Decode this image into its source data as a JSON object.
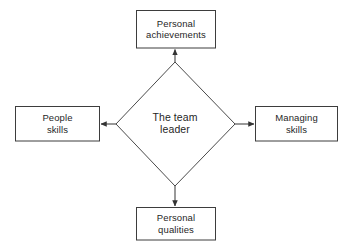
{
  "diagram": {
    "title": "The team leader",
    "type": "radial-diamond-diagram",
    "background_color": "#ffffff",
    "stroke_color": "#404040",
    "text_color": "#1f1f1f",
    "center": {
      "shape": "diamond",
      "label": "The team\nleader",
      "label_line1": "The team",
      "label_line2": "leader"
    },
    "nodes": [
      {
        "id": "personal-achievements",
        "label": "Personal\nachievements",
        "line1": "Personal",
        "line2": "achievements",
        "position": "top",
        "shape": "rectangle"
      },
      {
        "id": "people-skills",
        "label": "People\nskills",
        "line1": "People",
        "line2": "skills",
        "position": "left",
        "shape": "rectangle"
      },
      {
        "id": "managing-skills",
        "label": "Managing\nskills",
        "line1": "Managing",
        "line2": "skills",
        "position": "right",
        "shape": "rectangle"
      },
      {
        "id": "personal-qualities",
        "label": "Personal\nqualities",
        "line1": "Personal",
        "line2": "qualities",
        "position": "bottom",
        "shape": "rectangle"
      }
    ],
    "connectors": [
      {
        "id": "arrow-up",
        "from": "center",
        "to": "personal-achievements",
        "direction": "up",
        "arrowhead": "filled-triangle"
      },
      {
        "id": "arrow-left",
        "from": "center",
        "to": "people-skills",
        "direction": "left",
        "arrowhead": "filled-triangle"
      },
      {
        "id": "arrow-right",
        "from": "center",
        "to": "managing-skills",
        "direction": "right",
        "arrowhead": "filled-triangle"
      },
      {
        "id": "arrow-down",
        "from": "center",
        "to": "personal-qualities",
        "direction": "down",
        "arrowhead": "filled-triangle"
      }
    ]
  }
}
